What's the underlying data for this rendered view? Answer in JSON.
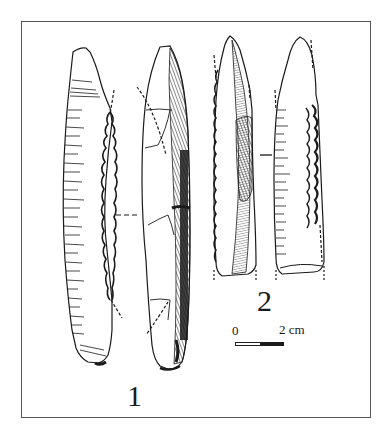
{
  "figure": {
    "type": "archaeological lithic illustration",
    "border_color": "#555555",
    "ink_color": "#1a1a1a",
    "background": "#ffffff",
    "items": [
      {
        "number": "1",
        "views": [
          "dorsal-retouched-edge",
          "lateral-ridge-view"
        ],
        "description": "elongated blade with retouched lateral edge"
      },
      {
        "number": "2",
        "views": [
          "ventral-view",
          "dorsal-retouched-view"
        ],
        "description": "pointed blade with bilateral retouch"
      }
    ],
    "scale": {
      "start_label": "0",
      "end_label": "2 cm",
      "segments": [
        "white",
        "black"
      ]
    }
  }
}
